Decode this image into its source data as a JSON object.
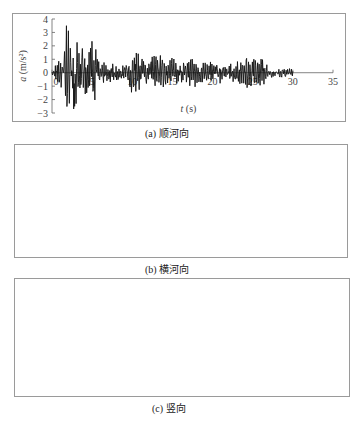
{
  "chart_data": [
    {
      "type": "line",
      "panel_id": "a",
      "caption": "(a) 顺河向",
      "title": "",
      "xlabel": "t (s)",
      "ylabel": "a (m/s²)",
      "xlim": [
        0,
        35
      ],
      "ylim": [
        -3,
        4
      ],
      "xticks": [
        0,
        5,
        10,
        15,
        20,
        25,
        30,
        35
      ],
      "yticks": [
        -3,
        -2,
        -1,
        0,
        1,
        2,
        3,
        4
      ],
      "grid": false,
      "legend": null,
      "series": [
        {
          "name": "顺河向加速度时程",
          "signal_duration_s": 30,
          "peak_positive": 3.5,
          "peak_positive_time_s": 1.8,
          "peak_negative": -2.7,
          "peak_negative_time_s": 2.7,
          "envelope": [
            {
              "t": 0,
              "amp": 0.2
            },
            {
              "t": 1,
              "amp": 1.5
            },
            {
              "t": 2,
              "amp": 3.5
            },
            {
              "t": 3,
              "amp": 2.6
            },
            {
              "t": 4,
              "amp": 2.0
            },
            {
              "t": 5,
              "amp": 2.5
            },
            {
              "t": 6,
              "amp": 1.5
            },
            {
              "t": 7,
              "amp": 0.8
            },
            {
              "t": 8,
              "amp": 0.7
            },
            {
              "t": 9,
              "amp": 0.5
            },
            {
              "t": 10,
              "amp": 1.8
            },
            {
              "t": 11,
              "amp": 1.4
            },
            {
              "t": 12,
              "amp": 0.9
            },
            {
              "t": 13,
              "amp": 1.7
            },
            {
              "t": 14,
              "amp": 1.2
            },
            {
              "t": 15,
              "amp": 1.1
            },
            {
              "t": 16,
              "amp": 0.9
            },
            {
              "t": 17,
              "amp": 1.0
            },
            {
              "t": 18,
              "amp": 1.2
            },
            {
              "t": 19,
              "amp": 0.8
            },
            {
              "t": 20,
              "amp": 0.9
            },
            {
              "t": 21,
              "amp": 0.8
            },
            {
              "t": 22,
              "amp": 0.8
            },
            {
              "t": 23,
              "amp": 1.1
            },
            {
              "t": 24,
              "amp": 1.3
            },
            {
              "t": 25,
              "amp": 1.3
            },
            {
              "t": 26,
              "amp": 1.3
            },
            {
              "t": 27,
              "amp": 0.5
            },
            {
              "t": 28,
              "amp": 0.4
            },
            {
              "t": 29,
              "amp": 0.4
            },
            {
              "t": 30,
              "amp": 0.3
            }
          ]
        }
      ]
    },
    {
      "type": "line",
      "panel_id": "b",
      "caption": "(b) 横河向",
      "title": "",
      "xlabel": "t (s)",
      "ylabel": "a (m/s²)",
      "xlim": [
        0,
        35
      ],
      "ylim": [
        -3,
        3
      ],
      "xticks": [
        0,
        5,
        10,
        15,
        20,
        25,
        30,
        35
      ],
      "yticks": [
        -3,
        -2,
        -1,
        0,
        1,
        2,
        3
      ],
      "grid": false,
      "legend": null,
      "series": [
        {
          "name": "横河向加速度时程",
          "signal_duration_s": 30,
          "peak_positive": 2.2,
          "peak_positive_time_s": 12.3,
          "peak_negative": -1.8,
          "peak_negative_time_s": 1.8,
          "envelope": [
            {
              "t": 0,
              "amp": 0.2
            },
            {
              "t": 1,
              "amp": 1.5
            },
            {
              "t": 2,
              "amp": 1.8
            },
            {
              "t": 3,
              "amp": 1.8
            },
            {
              "t": 4,
              "amp": 1.2
            },
            {
              "t": 5,
              "amp": 1.6
            },
            {
              "t": 6,
              "amp": 1.2
            },
            {
              "t": 7,
              "amp": 1.0
            },
            {
              "t": 8,
              "amp": 1.0
            },
            {
              "t": 9,
              "amp": 1.2
            },
            {
              "t": 10,
              "amp": 1.1
            },
            {
              "t": 11,
              "amp": 1.0
            },
            {
              "t": 12,
              "amp": 2.2
            },
            {
              "t": 13,
              "amp": 1.2
            },
            {
              "t": 14,
              "amp": 1.0
            },
            {
              "t": 15,
              "amp": 0.9
            },
            {
              "t": 16,
              "amp": 0.8
            },
            {
              "t": 17,
              "amp": 0.9
            },
            {
              "t": 18,
              "amp": 1.0
            },
            {
              "t": 19,
              "amp": 0.9
            },
            {
              "t": 20,
              "amp": 1.2
            },
            {
              "t": 21,
              "amp": 0.9
            },
            {
              "t": 22,
              "amp": 0.9
            },
            {
              "t": 23,
              "amp": 0.8
            },
            {
              "t": 24,
              "amp": 1.1
            },
            {
              "t": 25,
              "amp": 1.5
            },
            {
              "t": 26,
              "amp": 1.2
            },
            {
              "t": 27,
              "amp": 0.6
            },
            {
              "t": 28,
              "amp": 0.4
            },
            {
              "t": 29,
              "amp": 0.4
            },
            {
              "t": 30,
              "amp": 0.3
            }
          ]
        }
      ]
    },
    {
      "type": "line",
      "panel_id": "c",
      "caption": "(c) 竖向",
      "title": "",
      "xlabel": "t (s)",
      "ylabel": "a (m/s²)",
      "xlim": [
        0,
        35
      ],
      "ylim": [
        -3,
        3
      ],
      "xticks": [
        0,
        5,
        10,
        15,
        20,
        25,
        30,
        35
      ],
      "yticks": [
        -3,
        -2,
        -1,
        0,
        1,
        2,
        3
      ],
      "grid": false,
      "legend": null,
      "series": [
        {
          "name": "竖向加速度时程",
          "signal_duration_s": 30,
          "peak_positive": 1.9,
          "peak_positive_time_s": 3.6,
          "peak_negative": -2.1,
          "peak_negative_time_s": 1.0,
          "envelope": [
            {
              "t": 0,
              "amp": 1.0
            },
            {
              "t": 1,
              "amp": 2.0
            },
            {
              "t": 2,
              "amp": 1.5
            },
            {
              "t": 3,
              "amp": 1.2
            },
            {
              "t": 4,
              "amp": 1.9
            },
            {
              "t": 5,
              "amp": 0.8
            },
            {
              "t": 6,
              "amp": 0.6
            },
            {
              "t": 7,
              "amp": 0.8
            },
            {
              "t": 8,
              "amp": 0.7
            },
            {
              "t": 9,
              "amp": 0.6
            },
            {
              "t": 10,
              "amp": 0.6
            },
            {
              "t": 11,
              "amp": 0.7
            },
            {
              "t": 12,
              "amp": 0.5
            },
            {
              "t": 13,
              "amp": 0.6
            },
            {
              "t": 14,
              "amp": 0.5
            },
            {
              "t": 15,
              "amp": 0.4
            },
            {
              "t": 16,
              "amp": 0.4
            },
            {
              "t": 17,
              "amp": 0.4
            },
            {
              "t": 18,
              "amp": 0.3
            },
            {
              "t": 19,
              "amp": 0.3
            },
            {
              "t": 20,
              "amp": 0.3
            },
            {
              "t": 21,
              "amp": 0.3
            },
            {
              "t": 22,
              "amp": 0.3
            },
            {
              "t": 23,
              "amp": 0.3
            },
            {
              "t": 24,
              "amp": 0.3
            },
            {
              "t": 25,
              "amp": 0.3
            },
            {
              "t": 26,
              "amp": 0.4
            },
            {
              "t": 27,
              "amp": 0.3
            },
            {
              "t": 28,
              "amp": 0.2
            },
            {
              "t": 29,
              "amp": 0.15
            },
            {
              "t": 30,
              "amp": 0.1
            }
          ]
        }
      ]
    }
  ],
  "figure": {
    "panels": [
      {
        "id": "a",
        "caption_prefix": "(a)",
        "caption_text": "顺河向",
        "xlabel_var": "t",
        "xlabel_unit": "(s)",
        "ylabel_var": "a",
        "ylabel_unit": "(m/s²)"
      },
      {
        "id": "b",
        "caption_prefix": "(b)",
        "caption_text": "横河向",
        "xlabel_var": "t",
        "xlabel_unit": "(s)",
        "ylabel_var": "a",
        "ylabel_unit": "(m/s²)"
      },
      {
        "id": "c",
        "caption_prefix": "(c)",
        "caption_text": "竖向",
        "xlabel_var": "t",
        "xlabel_unit": "(s)",
        "ylabel_var": "a",
        "ylabel_unit": "(m/s²)"
      }
    ]
  },
  "colors": {
    "trace": "#111111",
    "axis": "#666666",
    "frame": "#9a9a9a",
    "text": "#444444"
  }
}
